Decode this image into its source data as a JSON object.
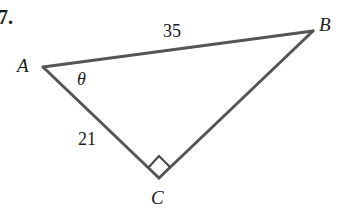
{
  "problem_number": "7.",
  "triangle": {
    "vertices": {
      "A": {
        "label": "A",
        "x": 43,
        "y": 67
      },
      "B": {
        "label": "B",
        "x": 313,
        "y": 31
      },
      "C": {
        "label": "C",
        "x": 159,
        "y": 178
      }
    },
    "sides": {
      "AB": {
        "label": "35"
      },
      "AC": {
        "label": "21"
      }
    },
    "angle_at_A": {
      "label": "θ"
    },
    "right_angle_at": "C",
    "stroke_color": "#555555"
  }
}
